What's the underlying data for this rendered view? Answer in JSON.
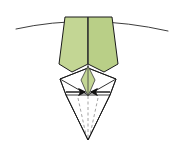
{
  "figure": {
    "type": "origami-diagram",
    "canvas": {
      "width": 174,
      "height": 155,
      "background": "#ffffff"
    },
    "colors": {
      "paper_front": "#c3d694",
      "paper_front_shade": "#b9cf87",
      "paper_back": "#ffffff",
      "edge_line": "#1a1a1a",
      "crease_line": "#4d4d4d",
      "dashed_crease": "#9a9a9a",
      "arrow_fill": "#111111",
      "guide_curve": "#3d3d3d"
    },
    "elements": [
      {
        "name": "guide-curve",
        "kind": "curve",
        "description": "long shallow curved reference line across the top of the model",
        "path": "M 16 29 Q 88 13 168 31",
        "stroke": "#3d3d3d",
        "stroke_width": 1.0,
        "fill": "none"
      },
      {
        "name": "green-body-left-panel",
        "kind": "polygon",
        "description": "left half of the large green tapering panel",
        "points": "65,17 88,17 88,64 72,72 59,64",
        "fill": "#c3d694",
        "stroke": "#1a1a1a",
        "stroke_width": 1.0
      },
      {
        "name": "green-body-right-panel",
        "kind": "polygon",
        "description": "right half of the large green tapering panel",
        "points": "88,17 112,17 118,64 104,72 88,64",
        "fill": "#b9cf87",
        "stroke": "#1a1a1a",
        "stroke_width": 1.0
      },
      {
        "name": "green-body-center-crease",
        "kind": "line",
        "description": "vertical centre crease down the green panel",
        "path": "M 88 17 L 88 66",
        "stroke": "#3a3a3a",
        "stroke_width": 0.9
      },
      {
        "name": "white-diamond-body",
        "kind": "polygon",
        "description": "white reverse side diamond with long pointed lower tip",
        "points": "88,68 116,79 110,95 88,140 66,95 60,79",
        "fill": "#ffffff",
        "stroke": "#1a1a1a",
        "stroke_width": 1.0
      },
      {
        "name": "white-diamond-left-fold",
        "kind": "line",
        "path": "M 60 79 L 88 95",
        "stroke": "#1a1a1a",
        "stroke_width": 0.9
      },
      {
        "name": "white-diamond-right-fold",
        "kind": "line",
        "path": "M 116 79 L 88 95",
        "stroke": "#1a1a1a",
        "stroke_width": 0.9
      },
      {
        "name": "white-diamond-left-edge-fold",
        "kind": "line",
        "path": "M 60 79 L 66 95",
        "stroke": "#1a1a1a",
        "stroke_width": 0.9
      },
      {
        "name": "white-diamond-right-edge-fold",
        "kind": "line",
        "path": "M 116 79 L 110 95",
        "stroke": "#1a1a1a",
        "stroke_width": 0.9
      },
      {
        "name": "white-diamond-left-upper-fold",
        "kind": "line",
        "path": "M 60 79 L 88 68",
        "stroke": "#1a1a1a",
        "stroke_width": 0.9
      },
      {
        "name": "white-diamond-right-upper-fold",
        "kind": "line",
        "path": "M 116 79 L 88 68",
        "stroke": "#1a1a1a",
        "stroke_width": 0.9
      },
      {
        "name": "inner-green-kite",
        "kind": "polygon",
        "description": "small green kite visible in the centre of the white diamond",
        "points": "88,66 95,80 88,96 81,80",
        "fill": "#c3d694",
        "stroke": "#3a3a3a",
        "stroke_width": 0.8
      },
      {
        "name": "inner-kite-center-line",
        "kind": "line",
        "path": "M 88 66 L 88 96",
        "stroke": "#3a3a3a",
        "stroke_width": 0.8
      },
      {
        "name": "left-fold-arrow",
        "kind": "arrow",
        "description": "solid arrow pointing right toward the centre, indicating an inward fold",
        "from": [
          66,
          92
        ],
        "to": [
          87,
          92
        ],
        "stroke": "#111111"
      },
      {
        "name": "right-fold-arrow",
        "kind": "arrow",
        "description": "solid arrow pointing left toward the centre, indicating an inward fold",
        "from": [
          110,
          92
        ],
        "to": [
          89,
          92
        ],
        "stroke": "#111111"
      },
      {
        "name": "dashed-crease-left",
        "kind": "dashed-line",
        "path": "M 78 98 L 86 135",
        "stroke": "#9a9a9a"
      },
      {
        "name": "dashed-crease-right",
        "kind": "dashed-line",
        "path": "M 98 98 L 90 135",
        "stroke": "#9a9a9a"
      },
      {
        "name": "dashed-crease-center",
        "kind": "dashed-line",
        "path": "M 88 96 L 88 138",
        "stroke": "#9a9a9a"
      },
      {
        "name": "lower-tip-left-edge",
        "kind": "line",
        "path": "M 66 95 L 88 140",
        "stroke": "#1a1a1a",
        "stroke_width": 1.0
      },
      {
        "name": "lower-tip-right-edge",
        "kind": "line",
        "path": "M 110 95 L 88 140",
        "stroke": "#1a1a1a",
        "stroke_width": 1.0
      }
    ]
  }
}
